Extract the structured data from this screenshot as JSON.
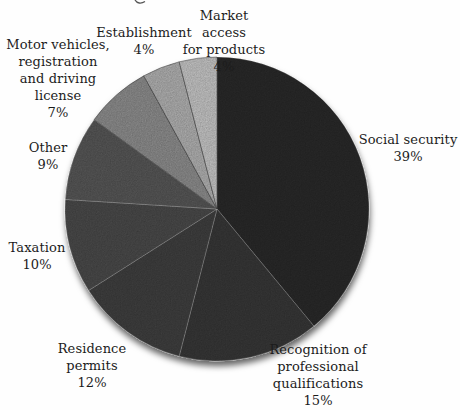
{
  "chart_data": {
    "type": "pie",
    "title": "",
    "unit": "%",
    "direction": "clockwise",
    "start_angle": "12-oclock",
    "legend": "none",
    "slices": [
      {
        "label": "Social security",
        "value": 39,
        "pct": "39%",
        "lines": [
          "Social security"
        ],
        "color": "#2b2b2b"
      },
      {
        "label": "Recognition of professional qualifications",
        "value": 15,
        "pct": "15%",
        "lines": [
          "Recognition of",
          "professional",
          "qualifications"
        ],
        "color": "#373737"
      },
      {
        "label": "Residence permits",
        "value": 12,
        "pct": "12%",
        "lines": [
          "Residence",
          "permits"
        ],
        "color": "#404040"
      },
      {
        "label": "Taxation",
        "value": 10,
        "pct": "10%",
        "lines": [
          "Taxation"
        ],
        "color": "#4b4b4b"
      },
      {
        "label": "Other",
        "value": 9,
        "pct": "9%",
        "lines": [
          "Other"
        ],
        "color": "#585858"
      },
      {
        "label": "Motor vehicles, registration and driving license",
        "value": 7,
        "pct": "7%",
        "lines": [
          "Motor vehicles,",
          "registration",
          "and driving",
          "license"
        ],
        "color": "#8f8f8f"
      },
      {
        "label": "Establishment",
        "value": 4,
        "pct": "4%",
        "lines": [
          "Establishment"
        ],
        "color": "#b3b3b3"
      },
      {
        "label": "Market access for products",
        "value": 4,
        "pct": "4%",
        "lines": [
          "Market access",
          "for products"
        ],
        "color": "#c8c8c8"
      }
    ]
  }
}
